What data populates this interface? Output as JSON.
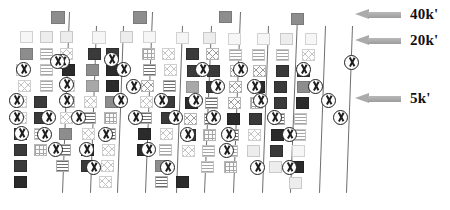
{
  "figure": {
    "type": "gel-electrophoresis-diagram",
    "title": "",
    "background_color": "#ffffff",
    "lane_line_color": "#6f6f6f"
  },
  "legend": {
    "items": [
      {
        "label": "40k'",
        "icon": "left-arrow-icon",
        "arrow_color": "#ababab",
        "y": 12
      },
      {
        "label": "20k'",
        "icon": "left-arrow-icon",
        "arrow_color": "#ababab",
        "y": 38
      },
      {
        "label": "5k'",
        "icon": "left-arrow-icon",
        "arrow_color": "#ababab",
        "y": 96
      }
    ]
  },
  "chart_data": {
    "type": "table",
    "title": "",
    "xlabel": "",
    "ylabel": "",
    "band_fill_legend": [
      "dark",
      "black",
      "mid",
      "gray",
      "light",
      "pale",
      "hstripe",
      "hstripe-light",
      "vstripe",
      "cross",
      "cross-light",
      "grid"
    ],
    "size_markers": [
      "40k'",
      "20k'",
      "5k'"
    ],
    "lane_separators": [
      {
        "x_top": 69,
        "x_bottom": 62,
        "y_top": 12,
        "y_bottom": 193
      },
      {
        "x_top": 96,
        "x_bottom": 90,
        "y_top": 26,
        "y_bottom": 193
      },
      {
        "x_top": 123,
        "x_bottom": 117,
        "y_top": 26,
        "y_bottom": 193
      },
      {
        "x_top": 152,
        "x_bottom": 145,
        "y_top": 12,
        "y_bottom": 193
      },
      {
        "x_top": 182,
        "x_bottom": 176,
        "y_top": 26,
        "y_bottom": 193
      },
      {
        "x_top": 211,
        "x_bottom": 204,
        "y_top": 26,
        "y_bottom": 193
      },
      {
        "x_top": 240,
        "x_bottom": 233,
        "y_top": 12,
        "y_bottom": 193
      },
      {
        "x_top": 268,
        "x_bottom": 262,
        "y_top": 26,
        "y_bottom": 193
      },
      {
        "x_top": 297,
        "x_bottom": 290,
        "y_top": 16,
        "y_bottom": 193
      },
      {
        "x_top": 325,
        "x_bottom": 319,
        "y_top": 26,
        "y_bottom": 193
      },
      {
        "x_top": 352,
        "x_bottom": 346,
        "y_top": 26,
        "y_bottom": 193
      }
    ],
    "well_markers": [
      {
        "x": 51,
        "y": 11,
        "w": 14,
        "h": 13,
        "fill": "mid"
      },
      {
        "x": 133,
        "y": 11,
        "w": 14,
        "h": 13,
        "fill": "mid"
      },
      {
        "x": 219,
        "y": 11,
        "w": 13,
        "h": 12,
        "fill": "mid"
      },
      {
        "x": 291,
        "y": 13,
        "w": 13,
        "h": 12,
        "fill": "mid"
      }
    ],
    "bands": [
      {
        "x": 20,
        "y": 31,
        "w": 13,
        "h": 12,
        "fill": "pale"
      },
      {
        "x": 40,
        "y": 31,
        "w": 13,
        "h": 12,
        "fill": "light"
      },
      {
        "x": 60,
        "y": 31,
        "w": 13,
        "h": 12,
        "fill": "light"
      },
      {
        "x": 92,
        "y": 31,
        "w": 14,
        "h": 13,
        "fill": "pale"
      },
      {
        "x": 120,
        "y": 31,
        "w": 13,
        "h": 12,
        "fill": "light"
      },
      {
        "x": 143,
        "y": 31,
        "w": 13,
        "h": 12,
        "fill": "pale"
      },
      {
        "x": 176,
        "y": 32,
        "w": 13,
        "h": 12,
        "fill": "pale"
      },
      {
        "x": 203,
        "y": 32,
        "w": 13,
        "h": 12,
        "fill": "light"
      },
      {
        "x": 228,
        "y": 33,
        "w": 13,
        "h": 12,
        "fill": "pale"
      },
      {
        "x": 257,
        "y": 33,
        "w": 13,
        "h": 12,
        "fill": "pale"
      },
      {
        "x": 280,
        "y": 33,
        "w": 13,
        "h": 12,
        "fill": "light"
      },
      {
        "x": 305,
        "y": 33,
        "w": 12,
        "h": 12,
        "fill": "pale"
      },
      {
        "x": 20,
        "y": 48,
        "w": 13,
        "h": 12,
        "fill": "mid"
      },
      {
        "x": 40,
        "y": 48,
        "w": 13,
        "h": 12,
        "fill": "hstripe-l"
      },
      {
        "x": 60,
        "y": 48,
        "w": 13,
        "h": 12,
        "fill": "cross-l"
      },
      {
        "x": 88,
        "y": 48,
        "w": 13,
        "h": 12,
        "fill": "dark"
      },
      {
        "x": 106,
        "y": 48,
        "w": 13,
        "h": 12,
        "fill": "dark"
      },
      {
        "x": 142,
        "y": 48,
        "w": 13,
        "h": 12,
        "fill": "grid"
      },
      {
        "x": 162,
        "y": 48,
        "w": 13,
        "h": 12,
        "fill": "cross-l"
      },
      {
        "x": 186,
        "y": 48,
        "w": 13,
        "h": 12,
        "fill": "dark"
      },
      {
        "x": 206,
        "y": 48,
        "w": 13,
        "h": 12,
        "fill": "cross"
      },
      {
        "x": 229,
        "y": 49,
        "w": 13,
        "h": 12,
        "fill": "hstripe-l"
      },
      {
        "x": 252,
        "y": 49,
        "w": 13,
        "h": 12,
        "fill": "hstripe-l"
      },
      {
        "x": 276,
        "y": 49,
        "w": 13,
        "h": 12,
        "fill": "hstripe-l"
      },
      {
        "x": 302,
        "y": 49,
        "w": 13,
        "h": 12,
        "fill": "cross-l"
      },
      {
        "x": 16,
        "y": 64,
        "w": 13,
        "h": 12,
        "fill": "light"
      },
      {
        "x": 40,
        "y": 64,
        "w": 13,
        "h": 12,
        "fill": "hstripe-l"
      },
      {
        "x": 62,
        "y": 64,
        "w": 13,
        "h": 12,
        "fill": "black"
      },
      {
        "x": 86,
        "y": 64,
        "w": 13,
        "h": 12,
        "fill": "mid"
      },
      {
        "x": 106,
        "y": 64,
        "w": 13,
        "h": 12,
        "fill": "black"
      },
      {
        "x": 143,
        "y": 64,
        "w": 13,
        "h": 12,
        "fill": "hstripe"
      },
      {
        "x": 164,
        "y": 64,
        "w": 13,
        "h": 12,
        "fill": "cross-l"
      },
      {
        "x": 187,
        "y": 65,
        "w": 13,
        "h": 12,
        "fill": "dark"
      },
      {
        "x": 207,
        "y": 65,
        "w": 13,
        "h": 12,
        "fill": "dark"
      },
      {
        "x": 230,
        "y": 65,
        "w": 13,
        "h": 12,
        "fill": "cross"
      },
      {
        "x": 253,
        "y": 65,
        "w": 13,
        "h": 12,
        "fill": "cross"
      },
      {
        "x": 276,
        "y": 65,
        "w": 13,
        "h": 12,
        "fill": "dark"
      },
      {
        "x": 297,
        "y": 65,
        "w": 13,
        "h": 12,
        "fill": "dark"
      },
      {
        "x": 18,
        "y": 80,
        "w": 13,
        "h": 12,
        "fill": "cross-l"
      },
      {
        "x": 40,
        "y": 80,
        "w": 13,
        "h": 12,
        "fill": "hstripe-l"
      },
      {
        "x": 62,
        "y": 80,
        "w": 13,
        "h": 12,
        "fill": "cross-l"
      },
      {
        "x": 86,
        "y": 80,
        "w": 13,
        "h": 12,
        "fill": "gray"
      },
      {
        "x": 106,
        "y": 80,
        "w": 13,
        "h": 12,
        "fill": "black"
      },
      {
        "x": 141,
        "y": 80,
        "w": 13,
        "h": 12,
        "fill": "cross"
      },
      {
        "x": 163,
        "y": 80,
        "w": 13,
        "h": 12,
        "fill": "hstripe"
      },
      {
        "x": 186,
        "y": 81,
        "w": 13,
        "h": 12,
        "fill": "gray"
      },
      {
        "x": 206,
        "y": 81,
        "w": 13,
        "h": 12,
        "fill": "dark"
      },
      {
        "x": 229,
        "y": 81,
        "w": 13,
        "h": 12,
        "fill": "cross"
      },
      {
        "x": 252,
        "y": 81,
        "w": 13,
        "h": 12,
        "fill": "black"
      },
      {
        "x": 274,
        "y": 81,
        "w": 13,
        "h": 12,
        "fill": "dark"
      },
      {
        "x": 297,
        "y": 81,
        "w": 13,
        "h": 12,
        "fill": "mid"
      },
      {
        "x": 14,
        "y": 96,
        "w": 13,
        "h": 12,
        "fill": "cross-l"
      },
      {
        "x": 34,
        "y": 96,
        "w": 13,
        "h": 12,
        "fill": "dark"
      },
      {
        "x": 62,
        "y": 96,
        "w": 13,
        "h": 12,
        "fill": "hstripe-l"
      },
      {
        "x": 84,
        "y": 96,
        "w": 13,
        "h": 12,
        "fill": "cross-l"
      },
      {
        "x": 105,
        "y": 96,
        "w": 13,
        "h": 12,
        "fill": "mid"
      },
      {
        "x": 140,
        "y": 96,
        "w": 13,
        "h": 12,
        "fill": "cross-l"
      },
      {
        "x": 162,
        "y": 96,
        "w": 13,
        "h": 12,
        "fill": "dark"
      },
      {
        "x": 185,
        "y": 97,
        "w": 13,
        "h": 12,
        "fill": "black"
      },
      {
        "x": 205,
        "y": 97,
        "w": 13,
        "h": 12,
        "fill": "hstripe"
      },
      {
        "x": 228,
        "y": 97,
        "w": 13,
        "h": 12,
        "fill": "cross"
      },
      {
        "x": 250,
        "y": 97,
        "w": 13,
        "h": 12,
        "fill": "grid"
      },
      {
        "x": 274,
        "y": 97,
        "w": 13,
        "h": 12,
        "fill": "dark"
      },
      {
        "x": 296,
        "y": 97,
        "w": 13,
        "h": 12,
        "fill": "black"
      },
      {
        "x": 14,
        "y": 112,
        "w": 13,
        "h": 12,
        "fill": "cross-l"
      },
      {
        "x": 34,
        "y": 112,
        "w": 13,
        "h": 12,
        "fill": "dark"
      },
      {
        "x": 60,
        "y": 112,
        "w": 13,
        "h": 12,
        "fill": "cross-l"
      },
      {
        "x": 83,
        "y": 112,
        "w": 13,
        "h": 12,
        "fill": "hstripe"
      },
      {
        "x": 104,
        "y": 112,
        "w": 13,
        "h": 12,
        "fill": "grid"
      },
      {
        "x": 139,
        "y": 112,
        "w": 13,
        "h": 12,
        "fill": "hstripe"
      },
      {
        "x": 161,
        "y": 112,
        "w": 13,
        "h": 12,
        "fill": "dark"
      },
      {
        "x": 184,
        "y": 113,
        "w": 13,
        "h": 12,
        "fill": "cross"
      },
      {
        "x": 204,
        "y": 113,
        "w": 13,
        "h": 12,
        "fill": "hstripe"
      },
      {
        "x": 227,
        "y": 113,
        "w": 13,
        "h": 12,
        "fill": "black"
      },
      {
        "x": 249,
        "y": 113,
        "w": 13,
        "h": 12,
        "fill": "dark"
      },
      {
        "x": 272,
        "y": 113,
        "w": 13,
        "h": 12,
        "fill": "hstripe"
      },
      {
        "x": 294,
        "y": 113,
        "w": 13,
        "h": 12,
        "fill": "hstripe-l"
      },
      {
        "x": 14,
        "y": 128,
        "w": 13,
        "h": 12,
        "fill": "dark"
      },
      {
        "x": 34,
        "y": 128,
        "w": 13,
        "h": 12,
        "fill": "hstripe-l"
      },
      {
        "x": 59,
        "y": 128,
        "w": 13,
        "h": 12,
        "fill": "mid"
      },
      {
        "x": 82,
        "y": 128,
        "w": 13,
        "h": 12,
        "fill": "cross-l"
      },
      {
        "x": 103,
        "y": 128,
        "w": 13,
        "h": 12,
        "fill": "hstripe"
      },
      {
        "x": 138,
        "y": 128,
        "w": 13,
        "h": 12,
        "fill": "black"
      },
      {
        "x": 160,
        "y": 128,
        "w": 13,
        "h": 12,
        "fill": "cross-l"
      },
      {
        "x": 183,
        "y": 129,
        "w": 13,
        "h": 12,
        "fill": "dark"
      },
      {
        "x": 203,
        "y": 129,
        "w": 13,
        "h": 12,
        "fill": "grid"
      },
      {
        "x": 226,
        "y": 129,
        "w": 13,
        "h": 12,
        "fill": "hstripe"
      },
      {
        "x": 248,
        "y": 129,
        "w": 13,
        "h": 12,
        "fill": "cross-l"
      },
      {
        "x": 271,
        "y": 129,
        "w": 13,
        "h": 12,
        "fill": "black"
      },
      {
        "x": 293,
        "y": 129,
        "w": 13,
        "h": 12,
        "fill": "hstripe-l"
      },
      {
        "x": 14,
        "y": 144,
        "w": 13,
        "h": 12,
        "fill": "dark"
      },
      {
        "x": 34,
        "y": 144,
        "w": 13,
        "h": 12,
        "fill": "grid"
      },
      {
        "x": 58,
        "y": 144,
        "w": 13,
        "h": 12,
        "fill": "hstripe"
      },
      {
        "x": 81,
        "y": 144,
        "w": 13,
        "h": 12,
        "fill": "black"
      },
      {
        "x": 102,
        "y": 144,
        "w": 13,
        "h": 12,
        "fill": "cross-l"
      },
      {
        "x": 137,
        "y": 144,
        "w": 13,
        "h": 12,
        "fill": "black"
      },
      {
        "x": 159,
        "y": 144,
        "w": 13,
        "h": 12,
        "fill": "hstripe-l"
      },
      {
        "x": 182,
        "y": 145,
        "w": 13,
        "h": 12,
        "fill": "cross-l"
      },
      {
        "x": 202,
        "y": 145,
        "w": 13,
        "h": 12,
        "fill": "hstripe-l"
      },
      {
        "x": 225,
        "y": 145,
        "w": 13,
        "h": 12,
        "fill": "hstripe-l"
      },
      {
        "x": 247,
        "y": 145,
        "w": 13,
        "h": 12,
        "fill": "light"
      },
      {
        "x": 270,
        "y": 145,
        "w": 13,
        "h": 12,
        "fill": "dark"
      },
      {
        "x": 292,
        "y": 145,
        "w": 13,
        "h": 12,
        "fill": "pale"
      },
      {
        "x": 14,
        "y": 160,
        "w": 13,
        "h": 12,
        "fill": "dark"
      },
      {
        "x": 56,
        "y": 160,
        "w": 13,
        "h": 12,
        "fill": "hstripe"
      },
      {
        "x": 81,
        "y": 160,
        "w": 13,
        "h": 12,
        "fill": "dark"
      },
      {
        "x": 101,
        "y": 160,
        "w": 13,
        "h": 12,
        "fill": "cross-l"
      },
      {
        "x": 155,
        "y": 160,
        "w": 13,
        "h": 12,
        "fill": "mid"
      },
      {
        "x": 201,
        "y": 161,
        "w": 13,
        "h": 12,
        "fill": "hstripe-l"
      },
      {
        "x": 224,
        "y": 161,
        "w": 13,
        "h": 12,
        "fill": "grid"
      },
      {
        "x": 269,
        "y": 161,
        "w": 13,
        "h": 12,
        "fill": "light"
      },
      {
        "x": 291,
        "y": 161,
        "w": 13,
        "h": 12,
        "fill": "black"
      },
      {
        "x": 14,
        "y": 176,
        "w": 13,
        "h": 12,
        "fill": "black"
      },
      {
        "x": 99,
        "y": 176,
        "w": 13,
        "h": 12,
        "fill": "cross-l"
      },
      {
        "x": 155,
        "y": 176,
        "w": 13,
        "h": 12,
        "fill": "hstripe"
      },
      {
        "x": 176,
        "y": 176,
        "w": 13,
        "h": 12,
        "fill": "black"
      },
      {
        "x": 289,
        "y": 177,
        "w": 13,
        "h": 12,
        "fill": "light"
      }
    ],
    "x_markers": [
      {
        "x": 16,
        "y": 62,
        "d": 15
      },
      {
        "x": 55,
        "y": 54,
        "d": 15
      },
      {
        "x": 59,
        "y": 77,
        "d": 15
      },
      {
        "x": 9,
        "y": 93,
        "d": 15
      },
      {
        "x": 41,
        "y": 110,
        "d": 15
      },
      {
        "x": 9,
        "y": 110,
        "d": 15
      },
      {
        "x": 59,
        "y": 93,
        "d": 15
      },
      {
        "x": 37,
        "y": 127,
        "d": 15
      },
      {
        "x": 79,
        "y": 142,
        "d": 15
      },
      {
        "x": 48,
        "y": 142,
        "d": 15
      },
      {
        "x": 50,
        "y": 54,
        "d": 15
      },
      {
        "x": 14,
        "y": 126,
        "d": 15
      },
      {
        "x": 116,
        "y": 62,
        "d": 15
      },
      {
        "x": 126,
        "y": 79,
        "d": 15
      },
      {
        "x": 113,
        "y": 93,
        "d": 15
      },
      {
        "x": 128,
        "y": 110,
        "d": 15
      },
      {
        "x": 98,
        "y": 127,
        "d": 15
      },
      {
        "x": 141,
        "y": 142,
        "d": 15
      },
      {
        "x": 154,
        "y": 93,
        "d": 15
      },
      {
        "x": 168,
        "y": 110,
        "d": 15
      },
      {
        "x": 180,
        "y": 127,
        "d": 15
      },
      {
        "x": 195,
        "y": 62,
        "d": 15
      },
      {
        "x": 210,
        "y": 79,
        "d": 15
      },
      {
        "x": 188,
        "y": 93,
        "d": 15
      },
      {
        "x": 206,
        "y": 110,
        "d": 15
      },
      {
        "x": 221,
        "y": 127,
        "d": 15
      },
      {
        "x": 233,
        "y": 62,
        "d": 15
      },
      {
        "x": 247,
        "y": 79,
        "d": 15
      },
      {
        "x": 253,
        "y": 93,
        "d": 15
      },
      {
        "x": 267,
        "y": 110,
        "d": 15
      },
      {
        "x": 282,
        "y": 127,
        "d": 15
      },
      {
        "x": 296,
        "y": 62,
        "d": 15
      },
      {
        "x": 308,
        "y": 79,
        "d": 15
      },
      {
        "x": 321,
        "y": 93,
        "d": 15
      },
      {
        "x": 333,
        "y": 110,
        "d": 15
      },
      {
        "x": 344,
        "y": 55,
        "d": 15
      },
      {
        "x": 86,
        "y": 160,
        "d": 15
      },
      {
        "x": 160,
        "y": 160,
        "d": 15
      },
      {
        "x": 250,
        "y": 160,
        "d": 15
      },
      {
        "x": 71,
        "y": 110,
        "d": 15
      },
      {
        "x": 104,
        "y": 52,
        "d": 15
      },
      {
        "x": 219,
        "y": 143,
        "d": 15
      },
      {
        "x": 282,
        "y": 160,
        "d": 15
      }
    ]
  }
}
